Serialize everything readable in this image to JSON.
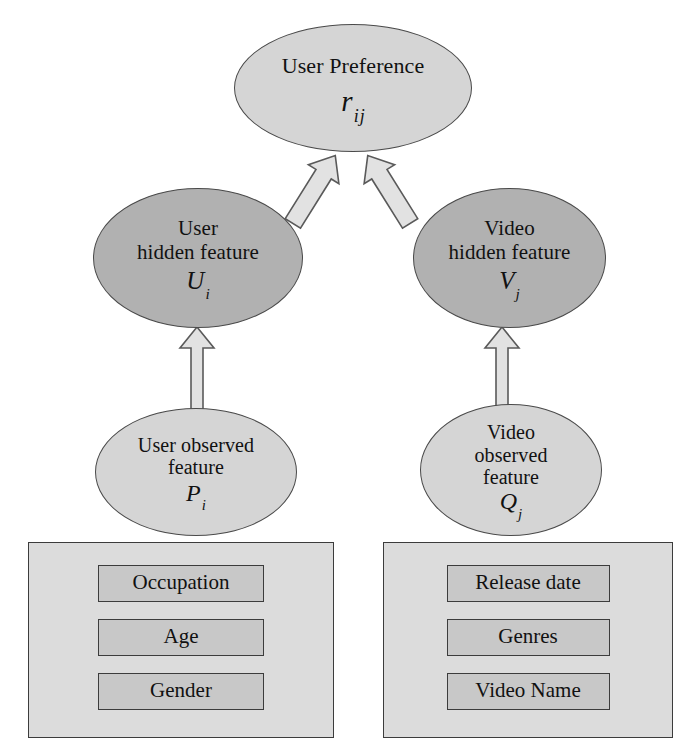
{
  "diagram": {
    "title_node": {
      "name": "user-preference",
      "lines": [
        "User Preference"
      ],
      "symbol": "r",
      "subscript": "ij",
      "fill": "#d5d5d5"
    },
    "nodes": [
      {
        "name": "user-hidden-feature",
        "lines": [
          "User",
          "hidden feature"
        ],
        "symbol": "U",
        "subscript": "i",
        "fill": "#b1b1b1"
      },
      {
        "name": "video-hidden-feature",
        "lines": [
          "Video",
          "hidden feature"
        ],
        "symbol": "V",
        "subscript": "j",
        "fill": "#b1b1b1"
      },
      {
        "name": "user-observed-feature",
        "lines": [
          "User observed",
          "feature"
        ],
        "symbol": "P",
        "subscript": "i",
        "fill": "#d5d5d5"
      },
      {
        "name": "video-observed-feature",
        "lines": [
          "Video",
          "observed",
          "feature"
        ],
        "symbol": "Q",
        "subscript": "j",
        "fill": "#d5d5d5"
      }
    ],
    "attribute_groups": [
      {
        "name": "user-attributes",
        "items": [
          "Occupation",
          "Age",
          "Gender"
        ]
      },
      {
        "name": "video-attributes",
        "items": [
          "Release date",
          "Genres",
          "Video Name"
        ]
      }
    ],
    "edges": [
      {
        "name": "user-hidden-to-preference",
        "from": "user-hidden-feature",
        "to": "user-preference",
        "style": "block-arrow"
      },
      {
        "name": "video-hidden-to-preference",
        "from": "video-hidden-feature",
        "to": "user-preference",
        "style": "block-arrow"
      },
      {
        "name": "user-observed-to-hidden",
        "from": "user-observed-feature",
        "to": "user-hidden-feature",
        "style": "block-arrow"
      },
      {
        "name": "video-observed-to-hidden",
        "from": "video-observed-feature",
        "to": "video-hidden-feature",
        "style": "block-arrow"
      }
    ],
    "colors": {
      "background": "#ffffff",
      "node_light": "#d5d5d5",
      "node_mid": "#b1b1b1",
      "container": "#dcdcdc",
      "attribute": "#c8c8c8",
      "outline": "#3c3c3c",
      "arrow_fill": "#e2e2e2"
    }
  }
}
